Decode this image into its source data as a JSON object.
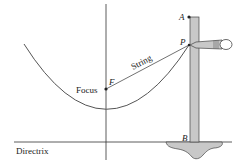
{
  "diagram": {
    "labels": {
      "focus": "Focus",
      "focus_point": "F",
      "string": "String",
      "point_p": "P",
      "point_a": "A",
      "point_b": "B",
      "directrix": "Directrix"
    },
    "colors": {
      "line": "#333333",
      "curve": "#555555",
      "post_fill": "#c8c8c8",
      "ground_fill": "#c8c8c8"
    }
  }
}
